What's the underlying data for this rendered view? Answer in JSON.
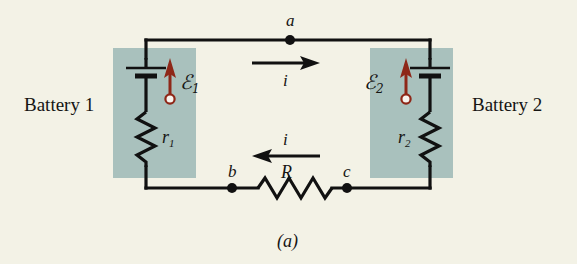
{
  "figure": {
    "caption": "(a)",
    "background_color": "#f3f2e6",
    "wire_color": "#111111",
    "shade_color": "#a9c1bd",
    "emf_arrow_color": "#8e2718"
  },
  "batteries": [
    {
      "name": "battery-1",
      "label": "Battery 1",
      "emf_symbol": "ℰ",
      "emf_subscript": "1",
      "internal_resistance_symbol": "r",
      "internal_resistance_subscript": "1"
    },
    {
      "name": "battery-2",
      "label": "Battery 2",
      "emf_symbol": "ℰ",
      "emf_subscript": "2",
      "internal_resistance_symbol": "r",
      "internal_resistance_subscript": "2"
    }
  ],
  "nodes": [
    {
      "name": "node-a",
      "label": "a"
    },
    {
      "name": "node-b",
      "label": "b"
    },
    {
      "name": "node-c",
      "label": "c"
    }
  ],
  "currents": [
    {
      "name": "current-top",
      "label": "i",
      "direction": "right"
    },
    {
      "name": "current-bottom",
      "label": "i",
      "direction": "left"
    }
  ],
  "resistor": {
    "name": "external-resistor",
    "label": "R"
  }
}
